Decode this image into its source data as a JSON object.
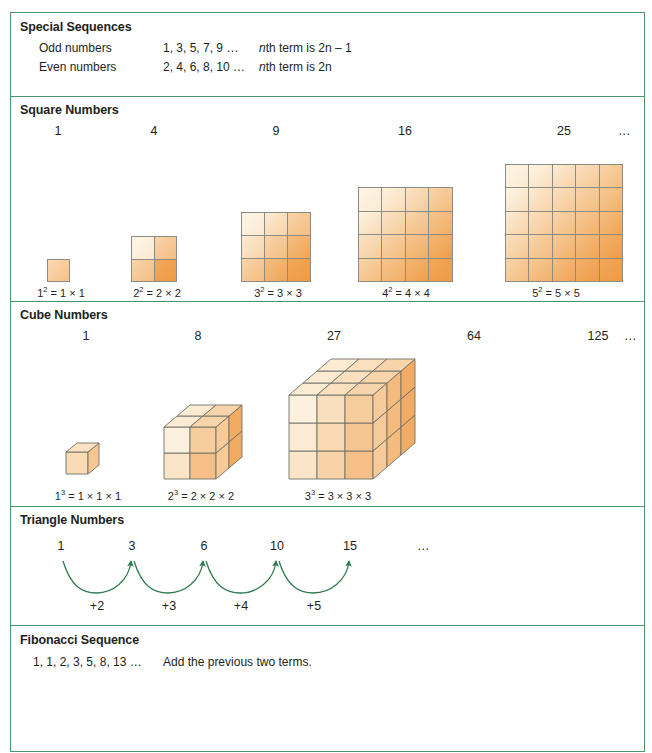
{
  "sections": {
    "special": {
      "title": "Special Sequences",
      "rows": [
        {
          "label": "Odd numbers",
          "sequence": "1, 3, 5, 7, 9 …",
          "rule_pre": "n",
          "rule_post": "th term is 2n – 1"
        },
        {
          "label": "Even numbers",
          "sequence": "2, 4, 6, 8, 10 …",
          "rule_pre": "n",
          "rule_post": "th term is 2n"
        }
      ]
    },
    "square": {
      "title": "Square Numbers",
      "numbers": [
        "1",
        "4",
        "9",
        "16",
        "25"
      ],
      "ellipsis": "…",
      "captions": [
        "1² = 1 × 1",
        "2² = 2 × 2",
        "3² = 3 × 3",
        "4² = 4 × 4",
        "5² = 5 × 5"
      ],
      "caption_parts": [
        {
          "base": "1",
          "exp": "2",
          "rest": " = 1 × 1"
        },
        {
          "base": "2",
          "exp": "2",
          "rest": " = 2 × 2"
        },
        {
          "base": "3",
          "exp": "2",
          "rest": " = 3 × 3"
        },
        {
          "base": "4",
          "exp": "2",
          "rest": " = 4 × 4"
        },
        {
          "base": "5",
          "exp": "2",
          "rest": " = 5 × 5"
        }
      ]
    },
    "cube": {
      "title": "Cube Numbers",
      "numbers": [
        "1",
        "8",
        "27",
        "64",
        "125"
      ],
      "ellipsis": "…",
      "caption_parts": [
        {
          "base": "1",
          "exp": "3",
          "rest": " = 1 × 1 × 1"
        },
        {
          "base": "2",
          "exp": "3",
          "rest": " = 2 × 2 × 2"
        },
        {
          "base": "3",
          "exp": "3",
          "rest": " = 3 × 3 × 3"
        }
      ]
    },
    "triangle": {
      "title": "Triangle Numbers",
      "numbers": [
        "1",
        "3",
        "6",
        "10",
        "15"
      ],
      "ellipsis": "…",
      "steps": [
        "+2",
        "+3",
        "+4",
        "+5"
      ]
    },
    "fibonacci": {
      "title": "Fibonacci Sequence",
      "sequence": "1, 1, 2, 3, 5, 8, 13 …",
      "rule": "Add the previous two terms."
    }
  },
  "colors": {
    "border_green": "#4e9468",
    "arrow_green": "#2f7b4f",
    "block_light": "#fdf6e6",
    "block_dark": "#ef9b45",
    "grid_line": "#6f6f68",
    "text": "#231f20"
  }
}
